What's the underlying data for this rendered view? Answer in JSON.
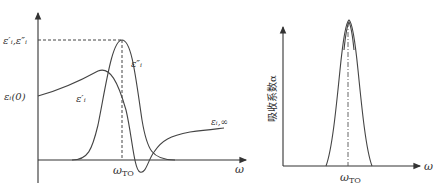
{
  "left_plot": {
    "y_axis_labels": {
      "peak": "ε′ᵢ,ε″ᵢ",
      "static": "εᵢ(0)"
    },
    "curve_labels": {
      "real": "ε′ᵢ",
      "imag": "ε″ᵢ",
      "high_freq": "εᵢ,∞"
    },
    "x_tick": "ω",
    "x_tick_sub": "TO",
    "x_axis_label": "ω"
  },
  "right_plot": {
    "y_axis_label": "吸收系数α",
    "x_tick": "ω",
    "x_tick_sub": "TO",
    "x_axis_label": "ω"
  }
}
